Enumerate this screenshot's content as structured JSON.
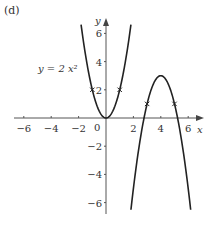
{
  "panel_label": "(d)",
  "equation_label": "y = 2 x²",
  "chart_data": {
    "type": "line",
    "title": "(d)",
    "xlabel": "x",
    "ylabel": "y",
    "xlim": [
      -6.5,
      6.5
    ],
    "ylim": [
      -6.5,
      6.5
    ],
    "x_ticks": [
      -6,
      -4,
      -2,
      2,
      4,
      6
    ],
    "y_ticks": [
      -6,
      -4,
      -2,
      2,
      4,
      6
    ],
    "origin_label": "0",
    "grid": false,
    "legend": null,
    "series": [
      {
        "name": "y = 2x^2",
        "equation": "y = 2x^2",
        "points": [
          [
            -1.8,
            6.5
          ],
          [
            -1,
            2
          ],
          [
            0,
            0
          ],
          [
            1,
            2
          ],
          [
            1.8,
            6.5
          ]
        ],
        "marked_points": [
          [
            -1,
            2
          ],
          [
            1,
            2
          ]
        ],
        "annotation": "y = 2 x²"
      },
      {
        "name": "transformed parabola",
        "equation": "y = -2(x-4)^2 + 3",
        "vertex": [
          4,
          3
        ],
        "points": [
          [
            1.82,
            -6.5
          ],
          [
            3,
            1
          ],
          [
            4,
            3
          ],
          [
            5,
            1
          ],
          [
            6.18,
            -6.5
          ]
        ],
        "marked_points": [
          [
            3,
            1
          ],
          [
            5,
            1
          ]
        ]
      }
    ]
  },
  "axes": {
    "x_name": "x",
    "y_name": "y",
    "origin": "0",
    "x_tick_labels": [
      "−6",
      "−4",
      "−2",
      "2",
      "4",
      "6"
    ],
    "y_tick_labels": [
      "6",
      "4",
      "2",
      "−2",
      "−4",
      "−6"
    ]
  },
  "colors": {
    "curve": "#222222",
    "axis": "#555555",
    "text": "#333333"
  }
}
